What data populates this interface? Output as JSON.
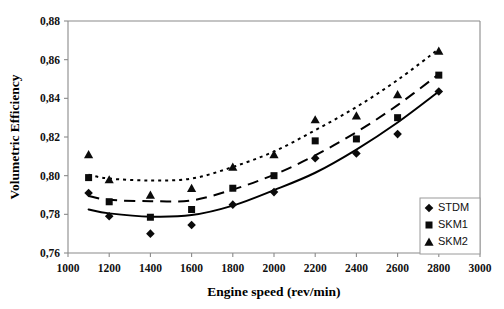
{
  "figure": {
    "title": "",
    "background_color": "#ffffff",
    "ink_color": "#000000",
    "axis_color": "#8a8a8a"
  },
  "axes": {
    "x_title": "Engine speed (rev/min)",
    "y_title": "Volumetric Efficiency",
    "x_ticks": [
      "1000",
      "1200",
      "1400",
      "1600",
      "1800",
      "2000",
      "2200",
      "2400",
      "2600",
      "2800",
      "3000"
    ],
    "y_ticks": [
      "0,88",
      "0,86",
      "0,84",
      "0,82",
      "0,80",
      "0,78",
      "0,76"
    ]
  },
  "legend": {
    "position": "inside-right-lower",
    "entries": [
      {
        "label": "STDM",
        "marker": "diamond-marker"
      },
      {
        "label": "SKM1",
        "marker": "square-marker"
      },
      {
        "label": "SKM2",
        "marker": "triangle-marker"
      }
    ]
  },
  "chart_data": {
    "type": "scatter",
    "title": "",
    "xlabel": "Engine speed (rev/min)",
    "ylabel": "Volumetric Efficiency",
    "xlim": [
      1000,
      3000
    ],
    "ylim": [
      0.76,
      0.88
    ],
    "xticks": [
      1000,
      1200,
      1400,
      1600,
      1800,
      2000,
      2200,
      2400,
      2600,
      2800,
      3000
    ],
    "yticks": [
      0.76,
      0.78,
      0.8,
      0.82,
      0.84,
      0.86,
      0.88
    ],
    "decimal_separator": ",",
    "grid": false,
    "x": [
      1100,
      1200,
      1400,
      1600,
      1800,
      2000,
      2200,
      2400,
      2600,
      2800
    ],
    "series": [
      {
        "name": "STDM",
        "marker": "diamond",
        "fit_line_style": "solid",
        "values": [
          0.791,
          0.779,
          0.77,
          0.7745,
          0.785,
          0.7915,
          0.809,
          0.8115,
          0.8215,
          0.8435
        ]
      },
      {
        "name": "SKM1",
        "marker": "square",
        "fit_line_style": "dashed",
        "values": [
          0.799,
          0.7865,
          0.7785,
          0.7825,
          0.7935,
          0.8,
          0.818,
          0.819,
          0.83,
          0.852
        ]
      },
      {
        "name": "SKM2",
        "marker": "triangle",
        "fit_line_style": "dotted",
        "values": [
          0.811,
          0.798,
          0.79,
          0.7935,
          0.8045,
          0.811,
          0.829,
          0.831,
          0.842,
          0.8645
        ]
      }
    ],
    "fit_curves": [
      {
        "name": "STDM-fit",
        "style": "solid",
        "points": [
          [
            1100,
            0.7825
          ],
          [
            1200,
            0.7805
          ],
          [
            1400,
            0.7788
          ],
          [
            1600,
            0.7796
          ],
          [
            1800,
            0.7845
          ],
          [
            2000,
            0.7925
          ],
          [
            2200,
            0.8015
          ],
          [
            2400,
            0.8135
          ],
          [
            2600,
            0.8275
          ],
          [
            2800,
            0.8435
          ]
        ]
      },
      {
        "name": "SKM1-fit",
        "style": "dashed",
        "points": [
          [
            1100,
            0.7895
          ],
          [
            1200,
            0.7875
          ],
          [
            1400,
            0.7868
          ],
          [
            1600,
            0.7872
          ],
          [
            1800,
            0.7928
          ],
          [
            2000,
            0.8005
          ],
          [
            2200,
            0.8105
          ],
          [
            2400,
            0.8225
          ],
          [
            2600,
            0.8365
          ],
          [
            2800,
            0.8525
          ]
        ]
      },
      {
        "name": "SKM2-fit",
        "style": "dotted",
        "points": [
          [
            1100,
            0.8005
          ],
          [
            1200,
            0.7985
          ],
          [
            1400,
            0.7975
          ],
          [
            1600,
            0.7985
          ],
          [
            1800,
            0.8045
          ],
          [
            2000,
            0.8125
          ],
          [
            2200,
            0.8235
          ],
          [
            2400,
            0.8355
          ],
          [
            2600,
            0.8495
          ],
          [
            2800,
            0.8655
          ]
        ]
      }
    ]
  }
}
